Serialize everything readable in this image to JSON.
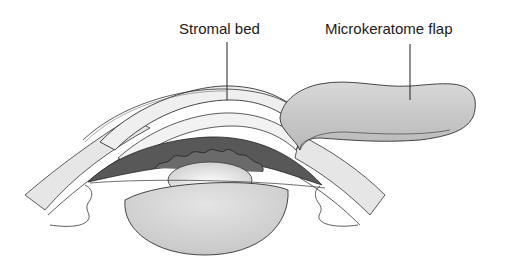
{
  "diagram": {
    "labels": [
      {
        "id": "stromal-bed",
        "text": "Stromal bed"
      },
      {
        "id": "microkeratome-flap",
        "text": "Microkeratome flap"
      }
    ],
    "colors": {
      "outline": "#333333",
      "cornea_fill": "#eeeeee",
      "flap_fill": "#cfcfcf",
      "iris_fill": "#555555",
      "lens_fill": "#d6d6d6",
      "sclera_fill": "#e6e6e6",
      "background": "#ffffff"
    }
  }
}
